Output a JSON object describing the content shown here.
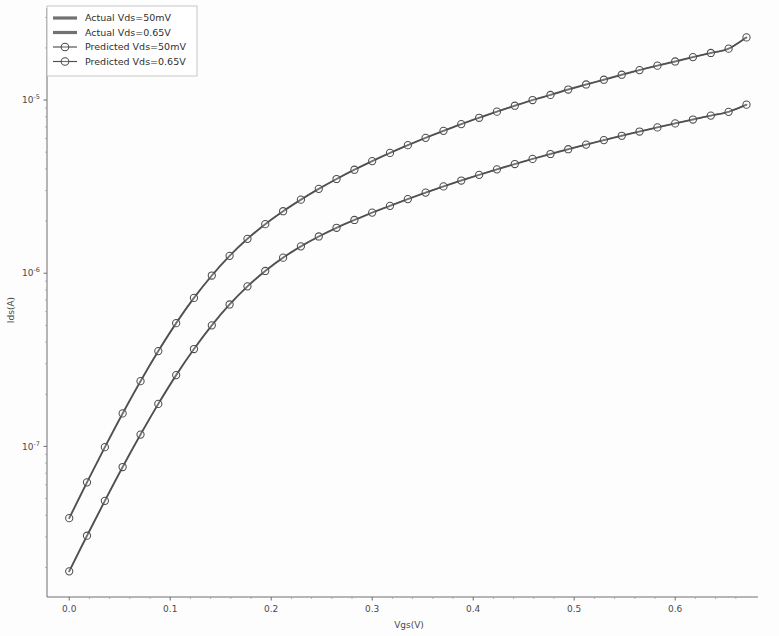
{
  "figure": {
    "background_color": "#fdfdfd",
    "line_color": "#4d4d4d",
    "marker_edge_color": "#4d4d4d",
    "marker_face_color": "#ffffff"
  },
  "chart_data": {
    "type": "line",
    "title": "",
    "xlabel": "Vgs(V)",
    "ylabel": "Ids(A)",
    "yscale": "log",
    "xscale": "linear",
    "xlim": [
      -0.022,
      0.682
    ],
    "ylim": [
      1.35e-08,
      3.4e-05
    ],
    "grid": false,
    "legend_position": "upper left",
    "xticks": [
      0.0,
      0.1,
      0.2,
      0.3,
      0.4,
      0.5,
      0.6
    ],
    "xtick_labels": [
      "0.0",
      "0.1",
      "0.2",
      "0.3",
      "0.4",
      "0.5",
      "0.6"
    ],
    "yticks": [
      1e-07,
      1e-06,
      1e-05
    ],
    "ytick_labels": [
      "10⁻⁷",
      "10⁻⁶",
      "10⁻⁵"
    ],
    "ytick_mantissa": "10",
    "ytick_exponents": [
      "-7",
      "-6",
      "-5"
    ],
    "series": [
      {
        "name": "Actual Vds=50mV",
        "style": "line",
        "marker": "none",
        "x": [
          0.0,
          0.0176,
          0.0353,
          0.0529,
          0.0706,
          0.0882,
          0.1059,
          0.1235,
          0.1412,
          0.1588,
          0.1765,
          0.1941,
          0.2118,
          0.2294,
          0.2471,
          0.2647,
          0.2824,
          0.3,
          0.3176,
          0.3353,
          0.3529,
          0.3706,
          0.3882,
          0.4059,
          0.4235,
          0.4412,
          0.4588,
          0.4765,
          0.4941,
          0.5118,
          0.5294,
          0.5471,
          0.5647,
          0.5824,
          0.6,
          0.6176,
          0.6353,
          0.6529,
          0.6706
        ],
        "y": [
          1.9e-08,
          3.05e-08,
          4.85e-08,
          7.6e-08,
          1.17e-07,
          1.76e-07,
          2.58e-07,
          3.65e-07,
          5e-07,
          6.6e-07,
          8.4e-07,
          1.03e-06,
          1.23e-06,
          1.43e-06,
          1.63e-06,
          1.83e-06,
          2.03e-06,
          2.24e-06,
          2.45e-06,
          2.68e-06,
          2.92e-06,
          3.17e-06,
          3.43e-06,
          3.7e-06,
          3.98e-06,
          4.27e-06,
          4.57e-06,
          4.88e-06,
          5.2e-06,
          5.53e-06,
          5.87e-06,
          6.22e-06,
          6.58e-06,
          6.95e-06,
          7.33e-06,
          7.72e-06,
          8.13e-06,
          8.55e-06,
          9.4e-06
        ]
      },
      {
        "name": "Actual Vds=0.65V",
        "style": "line",
        "marker": "none",
        "x": [
          0.0,
          0.0176,
          0.0353,
          0.0529,
          0.0706,
          0.0882,
          0.1059,
          0.1235,
          0.1412,
          0.1588,
          0.1765,
          0.1941,
          0.2118,
          0.2294,
          0.2471,
          0.2647,
          0.2824,
          0.3,
          0.3176,
          0.3353,
          0.3529,
          0.3706,
          0.3882,
          0.4059,
          0.4235,
          0.4412,
          0.4588,
          0.4765,
          0.4941,
          0.5118,
          0.5294,
          0.5471,
          0.5647,
          0.5824,
          0.6,
          0.6176,
          0.6353,
          0.6529,
          0.6706
        ],
        "y": [
          3.85e-08,
          6.2e-08,
          9.9e-08,
          1.55e-07,
          2.38e-07,
          3.55e-07,
          5.15e-07,
          7.2e-07,
          9.7e-07,
          1.26e-06,
          1.58e-06,
          1.92e-06,
          2.28e-06,
          2.66e-06,
          3.07e-06,
          3.5e-06,
          3.96e-06,
          4.44e-06,
          4.95e-06,
          5.49e-06,
          6.05e-06,
          6.64e-06,
          7.26e-06,
          7.9e-06,
          8.57e-06,
          9.27e-06,
          1e-05,
          1.07e-05,
          1.15e-05,
          1.23e-05,
          1.31e-05,
          1.4e-05,
          1.49e-05,
          1.58e-05,
          1.67e-05,
          1.77e-05,
          1.87e-05,
          1.98e-05,
          2.3e-05
        ]
      },
      {
        "name": "Predicted Vds=50mV",
        "style": "line-marker",
        "marker": "circle",
        "x": [
          0.0,
          0.0176,
          0.0353,
          0.0529,
          0.0706,
          0.0882,
          0.1059,
          0.1235,
          0.1412,
          0.1588,
          0.1765,
          0.1941,
          0.2118,
          0.2294,
          0.2471,
          0.2647,
          0.2824,
          0.3,
          0.3176,
          0.3353,
          0.3529,
          0.3706,
          0.3882,
          0.4059,
          0.4235,
          0.4412,
          0.4588,
          0.4765,
          0.4941,
          0.5118,
          0.5294,
          0.5471,
          0.5647,
          0.5824,
          0.6,
          0.6176,
          0.6353,
          0.6529,
          0.6706
        ],
        "y": [
          1.9e-08,
          3.05e-08,
          4.85e-08,
          7.6e-08,
          1.17e-07,
          1.76e-07,
          2.58e-07,
          3.65e-07,
          5e-07,
          6.6e-07,
          8.4e-07,
          1.03e-06,
          1.23e-06,
          1.43e-06,
          1.63e-06,
          1.83e-06,
          2.03e-06,
          2.24e-06,
          2.45e-06,
          2.68e-06,
          2.92e-06,
          3.17e-06,
          3.43e-06,
          3.7e-06,
          3.98e-06,
          4.27e-06,
          4.57e-06,
          4.88e-06,
          5.2e-06,
          5.53e-06,
          5.87e-06,
          6.22e-06,
          6.58e-06,
          6.95e-06,
          7.33e-06,
          7.72e-06,
          8.13e-06,
          8.55e-06,
          9.4e-06
        ]
      },
      {
        "name": "Predicted Vds=0.65V",
        "style": "line-marker",
        "marker": "circle",
        "x": [
          0.0,
          0.0176,
          0.0353,
          0.0529,
          0.0706,
          0.0882,
          0.1059,
          0.1235,
          0.1412,
          0.1588,
          0.1765,
          0.1941,
          0.2118,
          0.2294,
          0.2471,
          0.2647,
          0.2824,
          0.3,
          0.3176,
          0.3353,
          0.3529,
          0.3706,
          0.3882,
          0.4059,
          0.4235,
          0.4412,
          0.4588,
          0.4765,
          0.4941,
          0.5118,
          0.5294,
          0.5471,
          0.5647,
          0.5824,
          0.6,
          0.6176,
          0.6353,
          0.6529,
          0.6706
        ],
        "y": [
          3.85e-08,
          6.2e-08,
          9.9e-08,
          1.55e-07,
          2.38e-07,
          3.55e-07,
          5.15e-07,
          7.2e-07,
          9.7e-07,
          1.26e-06,
          1.58e-06,
          1.92e-06,
          2.28e-06,
          2.66e-06,
          3.07e-06,
          3.5e-06,
          3.96e-06,
          4.44e-06,
          4.95e-06,
          5.49e-06,
          6.05e-06,
          6.64e-06,
          7.26e-06,
          7.9e-06,
          8.57e-06,
          9.27e-06,
          1e-05,
          1.07e-05,
          1.15e-05,
          1.23e-05,
          1.31e-05,
          1.4e-05,
          1.49e-05,
          1.58e-05,
          1.67e-05,
          1.77e-05,
          1.87e-05,
          1.98e-05,
          2.3e-05
        ]
      }
    ],
    "legend": [
      "Actual Vds=50mV",
      "Actual Vds=0.65V",
      "Predicted Vds=50mV",
      "Predicted Vds=0.65V"
    ]
  }
}
